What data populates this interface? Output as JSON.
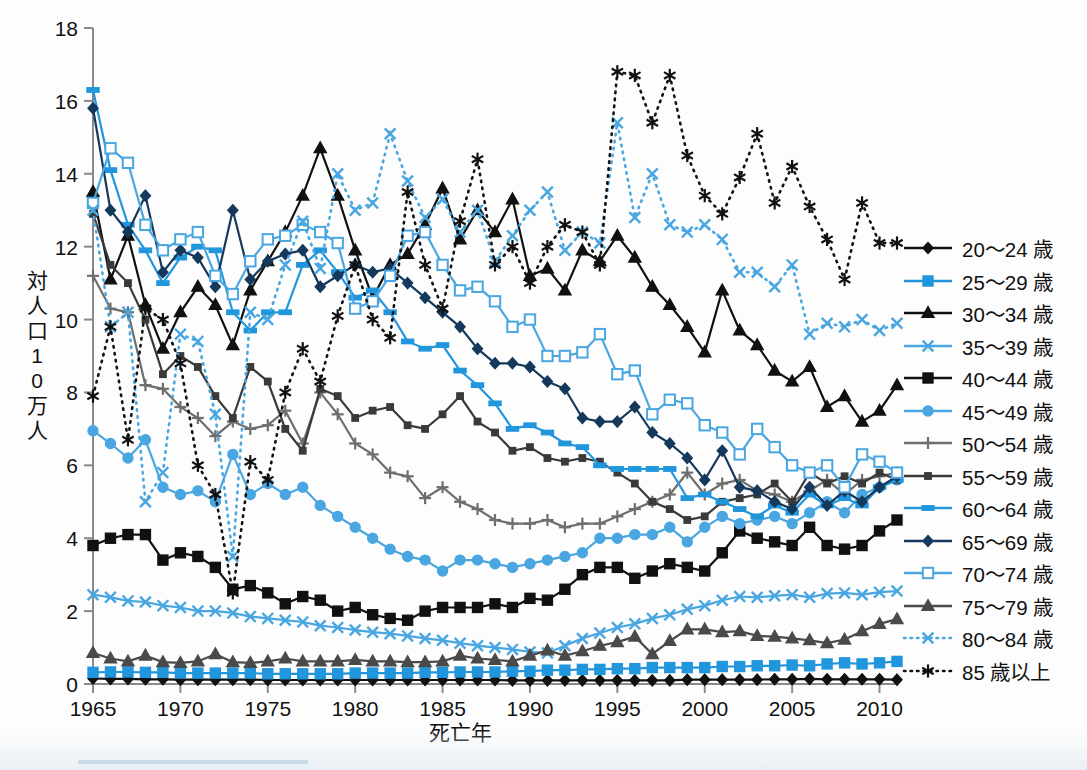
{
  "axes": {
    "y_title_chars": [
      "対",
      "人",
      "口",
      "1",
      "0",
      "万",
      "人"
    ],
    "y_title": "対人口10万人",
    "x_title": "死亡年",
    "y_ticks": [
      "0",
      "2",
      "4",
      "6",
      "8",
      "10",
      "12",
      "14",
      "16",
      "18"
    ],
    "x_ticks": [
      "1965",
      "1970",
      "1975",
      "1980",
      "1985",
      "1990",
      "1995",
      "2000",
      "2005",
      "2010"
    ]
  },
  "legend": {
    "items": [
      {
        "label": "20〜24 歳",
        "color": "#111111",
        "marker": "diamond",
        "fill": "solid",
        "dash": "none"
      },
      {
        "label": "25〜29 歳",
        "color": "#2196dd",
        "marker": "square",
        "fill": "solid",
        "dash": "none"
      },
      {
        "label": "30〜34 歳",
        "color": "#111111",
        "marker": "triangle",
        "fill": "solid",
        "dash": "none"
      },
      {
        "label": "35〜39 歳",
        "color": "#49a6e0",
        "marker": "x",
        "fill": "solid",
        "dash": "none"
      },
      {
        "label": "40〜44 歳",
        "color": "#111111",
        "marker": "square",
        "fill": "solid",
        "dash": "none"
      },
      {
        "label": "45〜49 歳",
        "color": "#49a6e0",
        "marker": "circle",
        "fill": "solid",
        "dash": "none"
      },
      {
        "label": "50〜54 歳",
        "color": "#6e6e6e",
        "marker": "plus",
        "fill": "solid",
        "dash": "none"
      },
      {
        "label": "55〜59 歳",
        "color": "#3a3a3a",
        "marker": "smallsquare",
        "fill": "solid",
        "dash": "none"
      },
      {
        "label": "60〜64 歳",
        "color": "#2196dd",
        "marker": "dash",
        "fill": "solid",
        "dash": "none"
      },
      {
        "label": "65〜69 歳",
        "color": "#15395c",
        "marker": "diamond",
        "fill": "solid",
        "dash": "none"
      },
      {
        "label": "70〜74 歳",
        "color": "#49a6e0",
        "marker": "opensquare",
        "fill": "open",
        "dash": "none"
      },
      {
        "label": "75〜79 歳",
        "color": "#4a4a4a",
        "marker": "triangle",
        "fill": "solid",
        "dash": "none"
      },
      {
        "label": "80〜84 歳",
        "color": "#49a6e0",
        "marker": "x",
        "fill": "solid",
        "dash": "dotted"
      },
      {
        "label": "85 歳以上",
        "color": "#111111",
        "marker": "asterisk",
        "fill": "solid",
        "dash": "dotted"
      }
    ]
  },
  "chart_data": {
    "type": "line",
    "title": "",
    "xlabel": "死亡年",
    "ylabel": "対人口10万人",
    "xlim": [
      1965,
      2011
    ],
    "ylim": [
      0,
      18
    ],
    "ytick_step": 2,
    "grid": false,
    "legend_position": "right",
    "x": [
      1965,
      1966,
      1967,
      1968,
      1969,
      1970,
      1971,
      1972,
      1973,
      1974,
      1975,
      1976,
      1977,
      1978,
      1979,
      1980,
      1981,
      1982,
      1983,
      1984,
      1985,
      1986,
      1987,
      1988,
      1989,
      1990,
      1991,
      1992,
      1993,
      1994,
      1995,
      1996,
      1997,
      1998,
      1999,
      2000,
      2001,
      2002,
      2003,
      2004,
      2005,
      2006,
      2007,
      2008,
      2009,
      2010,
      2011
    ],
    "series": [
      {
        "name": "20〜24 歳",
        "color": "#111111",
        "marker": "diamond",
        "dash": "none",
        "values": [
          0.15,
          0.14,
          0.14,
          0.13,
          0.13,
          0.12,
          0.12,
          0.12,
          0.12,
          0.12,
          0.11,
          0.11,
          0.11,
          0.11,
          0.11,
          0.11,
          0.11,
          0.11,
          0.11,
          0.11,
          0.11,
          0.11,
          0.11,
          0.11,
          0.1,
          0.1,
          0.1,
          0.1,
          0.1,
          0.1,
          0.1,
          0.1,
          0.1,
          0.1,
          0.12,
          0.12,
          0.12,
          0.12,
          0.12,
          0.13,
          0.13,
          0.14,
          0.13,
          0.13,
          0.13,
          0.13,
          0.12
        ]
      },
      {
        "name": "25〜29 歳",
        "color": "#2196dd",
        "marker": "square",
        "dash": "none",
        "values": [
          0.32,
          0.33,
          0.33,
          0.32,
          0.32,
          0.3,
          0.3,
          0.3,
          0.3,
          0.3,
          0.28,
          0.28,
          0.28,
          0.28,
          0.28,
          0.3,
          0.3,
          0.3,
          0.3,
          0.32,
          0.32,
          0.33,
          0.33,
          0.33,
          0.35,
          0.35,
          0.38,
          0.38,
          0.4,
          0.4,
          0.42,
          0.42,
          0.45,
          0.45,
          0.45,
          0.45,
          0.48,
          0.48,
          0.5,
          0.5,
          0.52,
          0.5,
          0.55,
          0.58,
          0.55,
          0.58,
          0.62
        ]
      },
      {
        "name": "30〜34 歳",
        "color": "#111111",
        "marker": "triangle",
        "dash": "none",
        "values": [
          13.5,
          11.1,
          12.3,
          10.4,
          9.2,
          10.2,
          10.9,
          10.4,
          9.3,
          10.8,
          11.6,
          12.4,
          13.4,
          14.7,
          13.4,
          11.9,
          10.6,
          11.5,
          11.8,
          12.6,
          13.6,
          12.2,
          13.0,
          12.4,
          13.3,
          11.2,
          11.4,
          10.8,
          11.9,
          11.6,
          12.3,
          11.7,
          10.9,
          10.4,
          9.8,
          9.1,
          10.8,
          9.7,
          9.3,
          8.6,
          8.3,
          8.7,
          7.6,
          7.9,
          7.2,
          7.5,
          8.2
        ]
      },
      {
        "name": "35〜39 歳",
        "color": "#49a6e0",
        "marker": "x",
        "dash": "none",
        "values": [
          2.45,
          2.38,
          2.28,
          2.25,
          2.15,
          2.1,
          2.0,
          2.0,
          1.95,
          1.85,
          1.8,
          1.75,
          1.7,
          1.6,
          1.55,
          1.48,
          1.42,
          1.38,
          1.32,
          1.25,
          1.2,
          1.12,
          1.05,
          1.0,
          0.95,
          0.88,
          0.85,
          1.05,
          1.25,
          1.4,
          1.55,
          1.65,
          1.8,
          1.9,
          2.05,
          2.15,
          2.3,
          2.4,
          2.38,
          2.42,
          2.45,
          2.38,
          2.48,
          2.5,
          2.45,
          2.52,
          2.55
        ]
      },
      {
        "name": "40〜44 歳",
        "color": "#111111",
        "marker": "square",
        "dash": "none",
        "values": [
          3.8,
          4.0,
          4.1,
          4.1,
          3.4,
          3.6,
          3.5,
          3.2,
          2.6,
          2.7,
          2.5,
          2.2,
          2.4,
          2.3,
          2.0,
          2.1,
          1.9,
          1.8,
          1.75,
          2.0,
          2.1,
          2.1,
          2.1,
          2.2,
          2.1,
          2.35,
          2.3,
          2.6,
          3.0,
          3.2,
          3.2,
          2.9,
          3.1,
          3.3,
          3.2,
          3.1,
          3.6,
          4.2,
          4.0,
          3.9,
          3.8,
          4.3,
          3.8,
          3.7,
          3.8,
          4.2,
          4.5
        ]
      },
      {
        "name": "45〜49 歳",
        "color": "#49a6e0",
        "marker": "circle",
        "dash": "none",
        "values": [
          6.95,
          6.6,
          6.2,
          6.7,
          5.4,
          5.2,
          5.3,
          5.0,
          6.3,
          5.2,
          5.5,
          5.2,
          5.4,
          4.9,
          4.6,
          4.3,
          4.0,
          3.7,
          3.5,
          3.4,
          3.1,
          3.4,
          3.4,
          3.3,
          3.2,
          3.3,
          3.4,
          3.5,
          3.6,
          4.0,
          4.0,
          4.1,
          4.1,
          4.3,
          3.9,
          4.3,
          4.6,
          4.4,
          4.5,
          4.6,
          4.4,
          4.7,
          5.0,
          4.7,
          5.2,
          5.4,
          5.6
        ]
      },
      {
        "name": "50〜54 歳",
        "color": "#6e6e6e",
        "marker": "plus",
        "dash": "none",
        "values": [
          11.2,
          10.3,
          10.2,
          8.2,
          8.1,
          7.6,
          7.3,
          6.8,
          7.2,
          7.0,
          7.1,
          7.5,
          6.6,
          8.0,
          7.4,
          6.6,
          6.3,
          5.8,
          5.7,
          5.1,
          5.4,
          5.0,
          4.8,
          4.5,
          4.4,
          4.4,
          4.5,
          4.3,
          4.4,
          4.4,
          4.6,
          4.8,
          5.0,
          5.2,
          5.8,
          5.2,
          5.5,
          5.6,
          5.3,
          5.2,
          5.0,
          5.3,
          5.6,
          5.2,
          5.6,
          5.7,
          5.8
        ]
      },
      {
        "name": "55〜59 歳",
        "color": "#3a3a3a",
        "marker": "smallsquare",
        "dash": "none",
        "values": [
          12.9,
          11.5,
          11.0,
          10.0,
          8.5,
          9.0,
          8.7,
          7.9,
          7.3,
          8.7,
          8.3,
          7.0,
          6.4,
          8.1,
          7.9,
          7.3,
          7.5,
          7.6,
          7.1,
          7.0,
          7.4,
          7.9,
          7.2,
          6.9,
          6.4,
          6.5,
          6.2,
          6.1,
          6.2,
          6.1,
          5.8,
          5.5,
          5.0,
          4.8,
          4.5,
          4.6,
          5.0,
          5.1,
          5.2,
          5.5,
          5.0,
          5.8,
          5.5,
          5.7,
          5.5,
          5.8,
          5.6
        ]
      },
      {
        "name": "60〜64 歳",
        "color": "#2196dd",
        "marker": "dash",
        "dash": "none",
        "values": [
          16.3,
          14.1,
          12.6,
          11.9,
          11.0,
          11.7,
          12.0,
          11.9,
          10.2,
          9.7,
          10.2,
          10.2,
          11.5,
          11.9,
          11.3,
          10.6,
          10.8,
          10.2,
          9.4,
          9.2,
          9.3,
          8.6,
          8.2,
          7.7,
          7.0,
          7.1,
          6.9,
          6.6,
          6.5,
          6.0,
          5.9,
          5.9,
          5.9,
          5.9,
          5.1,
          5.2,
          5.0,
          4.8,
          4.6,
          4.9,
          4.7,
          5.2,
          4.9,
          5.1,
          4.9,
          5.4,
          5.6
        ]
      },
      {
        "name": "65〜69 歳",
        "color": "#15395c",
        "marker": "diamond",
        "dash": "none",
        "values": [
          15.8,
          13.0,
          12.4,
          13.4,
          11.3,
          11.9,
          11.7,
          10.9,
          13.0,
          11.1,
          11.6,
          11.8,
          11.9,
          10.9,
          11.2,
          11.5,
          11.3,
          11.4,
          11.0,
          10.6,
          10.2,
          9.8,
          9.2,
          8.8,
          8.8,
          8.7,
          8.3,
          8.1,
          7.3,
          7.2,
          7.2,
          7.6,
          6.9,
          6.6,
          6.2,
          5.6,
          6.4,
          5.4,
          5.3,
          5.0,
          4.8,
          5.4,
          4.9,
          5.3,
          5.0,
          5.4,
          5.7
        ]
      },
      {
        "name": "70〜74 歳",
        "color": "#49a6e0",
        "marker": "opensquare",
        "dash": "none",
        "values": [
          13.2,
          14.7,
          14.3,
          12.6,
          11.9,
          12.2,
          12.4,
          11.2,
          10.7,
          11.6,
          12.2,
          12.3,
          12.6,
          12.4,
          12.1,
          10.3,
          10.5,
          11.2,
          12.3,
          12.4,
          11.5,
          10.8,
          10.9,
          10.5,
          9.8,
          10.0,
          9.0,
          9.0,
          9.1,
          9.6,
          8.5,
          8.6,
          7.4,
          7.8,
          7.7,
          7.1,
          6.9,
          6.3,
          7.0,
          6.5,
          6.0,
          5.8,
          6.0,
          5.4,
          6.3,
          6.1,
          5.8
        ]
      },
      {
        "name": "75〜79 歳",
        "color": "#4a4a4a",
        "marker": "triangle",
        "dash": "none",
        "values": [
          0.85,
          0.7,
          0.62,
          0.78,
          0.6,
          0.58,
          0.62,
          0.82,
          0.6,
          0.58,
          0.62,
          0.7,
          0.62,
          0.62,
          0.62,
          0.66,
          0.62,
          0.62,
          0.6,
          0.6,
          0.62,
          0.78,
          0.7,
          0.66,
          0.62,
          0.78,
          0.92,
          0.78,
          0.9,
          1.05,
          1.15,
          1.3,
          0.82,
          1.18,
          1.5,
          1.5,
          1.42,
          1.45,
          1.32,
          1.3,
          1.25,
          1.2,
          1.12,
          1.22,
          1.45,
          1.65,
          1.78
        ]
      },
      {
        "name": "80〜84 歳",
        "color": "#49a6e0",
        "marker": "x",
        "dash": "dotted",
        "values": [
          13.0,
          9.8,
          10.2,
          5.0,
          5.8,
          9.6,
          9.4,
          7.4,
          3.5,
          10.2,
          10.0,
          11.5,
          12.7,
          11.4,
          14.0,
          13.0,
          13.2,
          15.1,
          13.8,
          12.8,
          13.3,
          12.4,
          13.0,
          11.6,
          12.3,
          13.0,
          13.5,
          11.9,
          12.4,
          12.1,
          15.4,
          12.8,
          14.0,
          12.6,
          12.4,
          12.6,
          12.2,
          11.3,
          11.3,
          10.9,
          11.5,
          9.6,
          9.9,
          9.8,
          10.0,
          9.7,
          9.9
        ]
      },
      {
        "name": "85 歳以上",
        "color": "#111111",
        "marker": "asterisk",
        "dash": "dotted",
        "values": [
          7.9,
          9.8,
          6.7,
          10.3,
          10.0,
          8.8,
          6.0,
          5.2,
          2.5,
          6.1,
          5.6,
          8.0,
          9.2,
          8.3,
          10.1,
          11.5,
          10.0,
          9.5,
          13.5,
          11.5,
          10.3,
          12.7,
          14.4,
          11.5,
          12.0,
          11.0,
          12.0,
          12.6,
          12.4,
          11.5,
          16.8,
          16.7,
          15.4,
          16.7,
          14.5,
          13.4,
          12.9,
          13.9,
          15.1,
          13.2,
          14.2,
          13.1,
          12.2,
          11.1,
          13.2,
          12.1,
          12.1
        ]
      }
    ]
  }
}
